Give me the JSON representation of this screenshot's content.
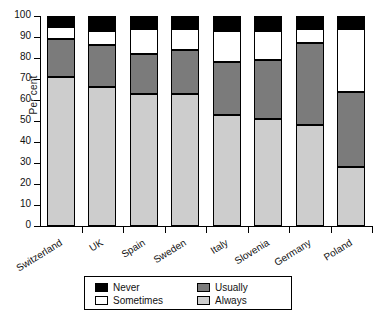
{
  "chart_data": {
    "type": "bar",
    "stacked": true,
    "title": "",
    "xlabel": "",
    "ylabel": "Per cent",
    "ylim": [
      0,
      100
    ],
    "ytick_step": 10,
    "yticks": [
      0,
      10,
      20,
      30,
      40,
      50,
      60,
      70,
      80,
      90,
      100
    ],
    "grid": false,
    "legend_position": "bottom",
    "categories": [
      "Switzerland",
      "UK",
      "Spain",
      "Sweden",
      "Italy",
      "Slovenia",
      "Germany",
      "Poland"
    ],
    "series": [
      {
        "name": "Always",
        "color": "#cdcdcd",
        "values": [
          71,
          66,
          63,
          63,
          53,
          51,
          48,
          28
        ]
      },
      {
        "name": "Usually",
        "color": "#7b7b7b",
        "values": [
          18,
          20,
          19,
          21,
          25,
          28,
          39,
          36
        ]
      },
      {
        "name": "Sometimes",
        "color": "#ffffff",
        "values": [
          6,
          7,
          12,
          10,
          15,
          14,
          7,
          30
        ]
      },
      {
        "name": "Never",
        "color": "#000000",
        "values": [
          5,
          7,
          6,
          6,
          7,
          7,
          6,
          6
        ]
      }
    ],
    "cumulative_tops": {
      "always": [
        71,
        66,
        63,
        63,
        53,
        51,
        48,
        28
      ],
      "usually": [
        89,
        86,
        82,
        84,
        78,
        79,
        87,
        64
      ],
      "sometimes": [
        95,
        93,
        94,
        94,
        93,
        93,
        94,
        94
      ],
      "never": [
        100,
        100,
        100,
        100,
        100,
        100,
        100,
        100
      ]
    }
  },
  "legend": {
    "entries": [
      {
        "label": "Never",
        "swatch": "sw-never"
      },
      {
        "label": "Sometimes",
        "swatch": "sw-sometimes"
      },
      {
        "label": "Usually",
        "swatch": "sw-usually"
      },
      {
        "label": "Always",
        "swatch": "sw-always"
      }
    ]
  }
}
